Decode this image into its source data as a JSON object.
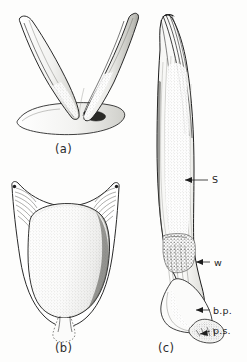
{
  "plate": {
    "kind": "scientific-line-drawing-plate",
    "background_color": "#fdfdfc",
    "ink_color": "#1d1d1d",
    "width": 247,
    "height": 362,
    "panel_count": 3
  },
  "captions": {
    "a": "(a)",
    "b": "(b)",
    "c": "(c)"
  },
  "panels": [
    {
      "id": "a",
      "caption": "(a)",
      "description": "paired V-shaped tapering arms rising from a flat basal plate, shown in oblique view"
    },
    {
      "id": "b",
      "caption": "(b)",
      "description": "broad cup-shaped frame with radiating arc striations at both upper horns enclosing a large stippled ovate body, with a dotted outline stalk below"
    },
    {
      "id": "c",
      "caption": "(c)",
      "description": "elongate shaft with curved pointed apex, longitudinal striations, a constricted waist, a basal plate and a small lobed process at the base"
    }
  ],
  "labels": [
    {
      "id": "s",
      "text": "S",
      "panel": "c",
      "meaning": "shaft"
    },
    {
      "id": "w",
      "text": "w",
      "panel": "c",
      "meaning": "waist"
    },
    {
      "id": "bp",
      "text": "b.p.",
      "panel": "c",
      "meaning": "basal plate"
    },
    {
      "id": "ps",
      "text": "p.s.",
      "panel": "c",
      "meaning": "process"
    }
  ]
}
